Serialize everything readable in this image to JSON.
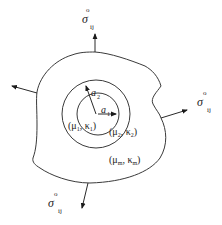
{
  "diagram": {
    "stress_label": {
      "symbol": "σ",
      "superscript": "o",
      "subscript": "ij"
    },
    "radii": {
      "inner": {
        "symbol": "a",
        "subscript": "1"
      },
      "outer": {
        "symbol": "a",
        "subscript": "2"
      }
    },
    "phases": [
      {
        "name": "phase-1",
        "text": "(μ",
        "sub1": "1",
        "mid": ", κ",
        "sub2": "1",
        "close": ")"
      },
      {
        "name": "phase-2",
        "text": "(μ",
        "sub1": "2",
        "mid": ", κ",
        "sub2": "2",
        "close": ")"
      },
      {
        "name": "matrix",
        "text": "(μ",
        "sub1": "m",
        "mid": ", κ",
        "sub2": "m",
        "close": ")"
      }
    ],
    "colors": {
      "line": "#3a3a3a",
      "text": "#222222",
      "background": "#ffffff"
    }
  }
}
